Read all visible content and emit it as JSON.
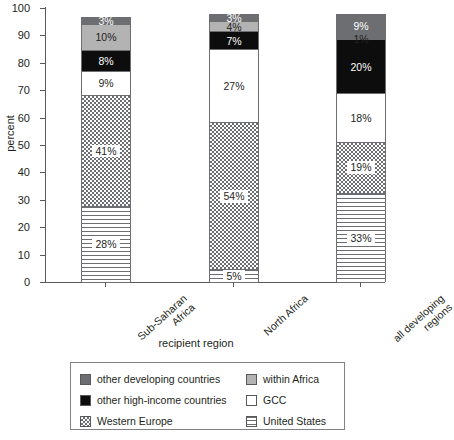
{
  "chart_data": {
    "type": "bar",
    "subtype": "stacked-percent",
    "title": "",
    "xlabel": "recipient region",
    "ylabel": "percent",
    "ylim": [
      0,
      100
    ],
    "yticks": [
      0,
      10,
      20,
      30,
      40,
      50,
      60,
      70,
      80,
      90,
      100
    ],
    "grid": false,
    "legend_position": "bottom",
    "categories": [
      "Sub-Saharan Africa",
      "North Africa",
      "all developing regions"
    ],
    "category_lines": [
      [
        "Sub-Saharan",
        "Africa"
      ],
      [
        "North Africa"
      ],
      [
        "all developing",
        "regions"
      ]
    ],
    "series": [
      {
        "name": "United States",
        "key": "us",
        "fill": "horizontal-lines",
        "color": "#6d6e71",
        "values": [
          28,
          5,
          33
        ]
      },
      {
        "name": "Western Europe",
        "key": "westeurope",
        "fill": "checkerboard",
        "color": "#6d6e71",
        "values": [
          41,
          54,
          19
        ]
      },
      {
        "name": "GCC",
        "key": "gcc",
        "fill": "solid",
        "color": "#ffffff",
        "values": [
          9,
          27,
          18
        ]
      },
      {
        "name": "other high-income countries",
        "key": "highincome",
        "fill": "solid",
        "color": "#0d0d0d",
        "values": [
          8,
          7,
          20
        ]
      },
      {
        "name": "within Africa",
        "key": "withinafrica",
        "fill": "solid",
        "color": "#b3b3b3",
        "values": [
          10,
          4,
          1
        ]
      },
      {
        "name": "other developing countries",
        "key": "otherdev",
        "fill": "solid",
        "color": "#6d6e71",
        "values": [
          3,
          3,
          9
        ]
      }
    ],
    "data_labels": [
      [
        "28%",
        "41%",
        "9%",
        "8%",
        "10%",
        "3%"
      ],
      [
        "5%",
        "54%",
        "27%",
        "7%",
        "4%",
        "3%"
      ],
      [
        "33%",
        "19%",
        "18%",
        "20%",
        "1%",
        "9%"
      ]
    ]
  },
  "axes": {
    "y_title": "percent",
    "x_title": "recipient region",
    "y_tick_labels": [
      "0",
      "10",
      "20",
      "30",
      "40",
      "50",
      "60",
      "70",
      "80",
      "90",
      "100"
    ]
  },
  "legend": {
    "left_column": [
      {
        "label": "other developing countries",
        "swatch": "otherdev"
      },
      {
        "label": "other high-income countries",
        "swatch": "highincome"
      },
      {
        "label": "Western Europe",
        "swatch": "westeurope"
      }
    ],
    "right_column": [
      {
        "label": "within Africa",
        "swatch": "withinafrica"
      },
      {
        "label": "GCC",
        "swatch": "gcc"
      },
      {
        "label": "United States",
        "swatch": "us"
      }
    ]
  },
  "colors": {
    "other_developing": "#6d6e71",
    "within_africa": "#b3b3b3",
    "other_high_income": "#0d0d0d",
    "gcc": "#ffffff",
    "pattern_stroke": "#6d6e71",
    "axis": "#58595b",
    "text": "#231f20"
  }
}
